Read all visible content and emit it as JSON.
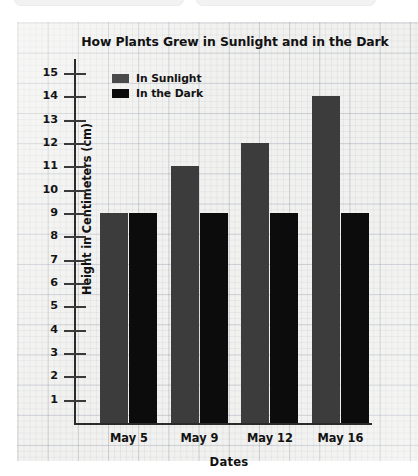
{
  "top_chrome": {
    "pill_left_label": "",
    "pill_right_label": ""
  },
  "chart_data": {
    "type": "bar",
    "title": "How Plants Grew in Sunlight and in the Dark",
    "xlabel": "Dates",
    "ylabel": "Height in Centimeters (cm)",
    "categories": [
      "May 5",
      "May 9",
      "May 12",
      "May 16"
    ],
    "series": [
      {
        "name": "In Sunlight",
        "color": "#3c3c3c",
        "values": [
          9,
          11,
          12,
          14
        ]
      },
      {
        "name": "In the Dark",
        "color": "#0c0c0c",
        "values": [
          9,
          9,
          9,
          9
        ]
      }
    ],
    "ylim": [
      0,
      15
    ],
    "ytick_labels": [
      "15",
      "14",
      "13",
      "12",
      "11",
      "10",
      "9",
      "8",
      "7",
      "6",
      "5",
      "4",
      "3",
      "2",
      "1"
    ],
    "ytick_values": [
      15,
      14,
      13,
      12,
      11,
      10,
      9,
      8,
      7,
      6,
      5,
      4,
      3,
      2,
      1
    ],
    "grid": true,
    "legend_position": "top-left",
    "background": "graph-paper"
  }
}
